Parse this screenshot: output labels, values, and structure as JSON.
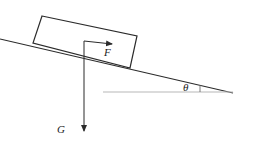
{
  "figure": {
    "kind": "physics-free-body-diagram",
    "background_color": "#ffffff",
    "stroke_color": "#2b2b2b",
    "baseline_color": "#b3b3b3",
    "labels": {
      "force": "F",
      "weight": "G",
      "angle": "θ"
    },
    "geometry": {
      "incline": {
        "x1": 0,
        "y1": 39,
        "x2": 233,
        "y2": 93
      },
      "baseline": {
        "x1": 103,
        "y1": 92,
        "x2": 233,
        "y2": 92
      },
      "angle_tick": {
        "x1": 200,
        "y1": 85,
        "x2": 200,
        "y2": 92
      },
      "block": {
        "top_left": {
          "x": 42,
          "y": 16
        },
        "top_right": {
          "x": 137,
          "y": 36
        },
        "bottom_right": {
          "x": 130,
          "y": 68
        },
        "bottom_left": {
          "x": 33,
          "y": 43
        }
      },
      "force_arrow": {
        "x1": 84,
        "y1": 41,
        "x2": 115,
        "y2": 44
      },
      "weight_arrow": {
        "x1": 84,
        "y1": 41,
        "x2": 84,
        "y2": 135
      }
    }
  }
}
